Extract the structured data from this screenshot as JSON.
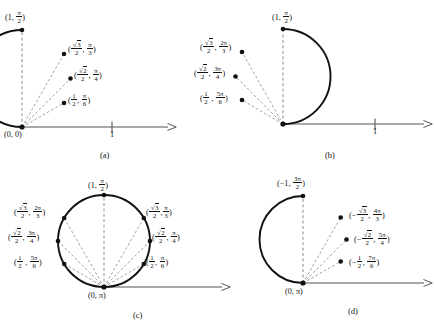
{
  "figure": {
    "stroke_color": "#111111",
    "axis_color": "#4d4d4d",
    "dashed_color": "#666666",
    "panels": [
      {
        "id": "a",
        "caption": "(a)",
        "pole_label": "(0, 0)",
        "axis_tick_label": "1",
        "points": [
          {
            "label_html": "(1, <fr>π/2</fr>)",
            "r": "1",
            "theta": "π/2"
          },
          {
            "label_html": "(√3/2, π/3)",
            "r": "√3/2",
            "theta": "π/3"
          },
          {
            "label_html": "(√2/2, π/4)",
            "r": "√2/2",
            "theta": "π/4"
          },
          {
            "label_html": "(1/2, π/6)",
            "r": "1/2",
            "theta": "π/6"
          }
        ]
      },
      {
        "id": "b",
        "caption": "(b)",
        "pole_label": "",
        "axis_tick_label": "1",
        "points": [
          {
            "label_html": "(1, π/2)",
            "r": "1",
            "theta": "π/2"
          },
          {
            "label_html": "(√3/2, 2π/3)",
            "r": "√3/2",
            "theta": "2π/3"
          },
          {
            "label_html": "(√2/2, 3π/4)",
            "r": "√2/2",
            "theta": "3π/4"
          },
          {
            "label_html": "(1/2, 5π/6)",
            "r": "1/2",
            "theta": "5π/6"
          }
        ]
      },
      {
        "id": "c",
        "caption": "(c)",
        "pole_label": "(0, π)",
        "axis_tick_label": "",
        "points": [
          {
            "label_html": "(1, π/2)",
            "r": "1",
            "theta": "π/2"
          },
          {
            "label_html": "(√3/2, π/3)",
            "r": "√3/2",
            "theta": "π/3"
          },
          {
            "label_html": "(√2/2, π/4)",
            "r": "√2/2",
            "theta": "π/4"
          },
          {
            "label_html": "(1/2, π/6)",
            "r": "1/2",
            "theta": "π/6"
          },
          {
            "label_html": "(√3/2, 2π/3)",
            "r": "√3/2",
            "theta": "2π/3"
          },
          {
            "label_html": "(√2/2, 3π/4)",
            "r": "√2/2",
            "theta": "3π/4"
          },
          {
            "label_html": "(1/2, 5π/6)",
            "r": "1/2",
            "theta": "5π/6"
          }
        ]
      },
      {
        "id": "d",
        "caption": "(d)",
        "pole_label": "(0, π)",
        "axis_tick_label": "",
        "points": [
          {
            "label_html": "(-1, 3π/2)",
            "r": "-1",
            "theta": "3π/2"
          },
          {
            "label_html": "(-√3/2, 4π/3)",
            "r": "-√3/2",
            "theta": "4π/3"
          },
          {
            "label_html": "(-√2/2, 5π/4)",
            "r": "-√2/2",
            "theta": "5π/4"
          },
          {
            "label_html": "(-1/2, 7π/6)",
            "r": "-1/2",
            "theta": "7π/6"
          }
        ]
      }
    ]
  },
  "captions": {
    "a": "(a)",
    "b": "(b)",
    "c": "(c)",
    "d": "(d)"
  },
  "tick_labels": {
    "a_one": "1",
    "b_one": "1"
  },
  "pole_labels": {
    "a": "(0, 0)",
    "c": "(0, π)",
    "d": "(0, π)"
  }
}
